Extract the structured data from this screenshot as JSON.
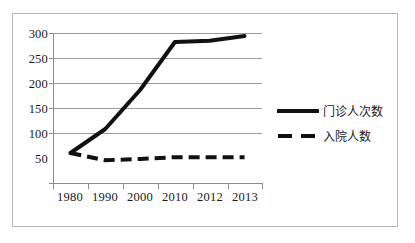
{
  "chart_data": {
    "type": "line",
    "title": "",
    "xlabel": "",
    "ylabel": "",
    "categories": [
      "1980",
      "1990",
      "2000",
      "2010",
      "2012",
      "2013"
    ],
    "ylim": [
      50,
      300
    ],
    "yticks": [
      "50",
      "100",
      "150",
      "200",
      "250",
      "300"
    ],
    "grid": true,
    "legend_position": "right",
    "series": [
      {
        "name": "门诊人次数",
        "style": "solid",
        "color": "#111111",
        "values": [
          100,
          140,
          205,
          285,
          287,
          295
        ]
      },
      {
        "name": "入院人数",
        "style": "dashed",
        "color": "#111111",
        "values": [
          100,
          88,
          90,
          93,
          93,
          93
        ]
      }
    ]
  },
  "legend": {
    "items": [
      {
        "label": "门诊人次数",
        "swatch": "solid-line-swatch"
      },
      {
        "label": "入院人数",
        "swatch": "dashed-line-swatch"
      }
    ]
  }
}
